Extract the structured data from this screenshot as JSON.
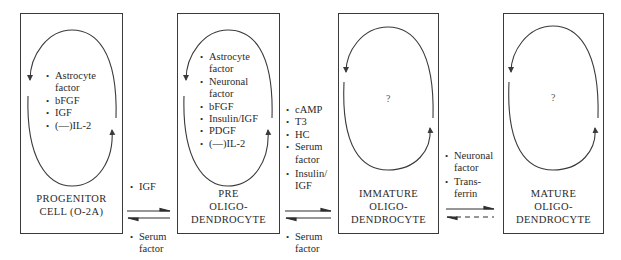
{
  "stages": [
    {
      "id": "progenitor",
      "label_lines": [
        "PROGENITOR",
        "CELL (O-2A)"
      ],
      "cycle_factors": [
        {
          "text": "Astrocyte",
          "cont": "factor"
        },
        {
          "text": "bFGF"
        },
        {
          "text": "IGF"
        },
        {
          "text": "(—)IL-2"
        }
      ]
    },
    {
      "id": "pre-oligodendrocyte",
      "label_lines": [
        "PRE",
        "OLIGO-",
        "DENDROCYTE"
      ],
      "cycle_factors": [
        {
          "text": "Astrocyte",
          "cont": "factor"
        },
        {
          "text": "Neuronal",
          "cont": "factor"
        },
        {
          "text": "bFGF"
        },
        {
          "text": "Insulin/IGF"
        },
        {
          "text": "PDGF"
        },
        {
          "text": "(—)IL-2"
        }
      ]
    },
    {
      "id": "immature-oligodendrocyte",
      "label_lines": [
        "IMMATURE",
        "OLIGO-",
        "DENDROCYTE"
      ],
      "cycle_unknown": "?"
    },
    {
      "id": "mature-oligodendrocyte",
      "label_lines": [
        "MATURE",
        "OLIGO-",
        "DENDROCYTE"
      ],
      "cycle_unknown": "?"
    }
  ],
  "transitions": [
    {
      "from": "progenitor",
      "to": "pre-oligodendrocyte",
      "forward_factors": [
        {
          "text": "IGF"
        }
      ],
      "reverse_factors": [
        {
          "text": "Serum",
          "cont": "factor"
        }
      ],
      "reverse_style": "solid"
    },
    {
      "from": "pre-oligodendrocyte",
      "to": "immature-oligodendrocyte",
      "forward_factors": [
        {
          "text": "cAMP"
        },
        {
          "text": "T3"
        },
        {
          "text": "HC"
        },
        {
          "text": "Serum",
          "cont": "factor"
        },
        {
          "text": "Insulin/",
          "cont": "IGF"
        }
      ],
      "reverse_factors": [
        {
          "text": "Serum",
          "cont": "factor"
        }
      ],
      "reverse_style": "solid"
    },
    {
      "from": "immature-oligodendrocyte",
      "to": "mature-oligodendrocyte",
      "forward_factors": [
        {
          "text": "Neuronal",
          "cont": "factor"
        },
        {
          "text": "Trans-",
          "cont": "ferrin"
        }
      ],
      "reverse_factors": [],
      "reverse_style": "dashed"
    }
  ],
  "colors": {
    "line": "#3a3a3a",
    "text": "#2a2a2a"
  }
}
